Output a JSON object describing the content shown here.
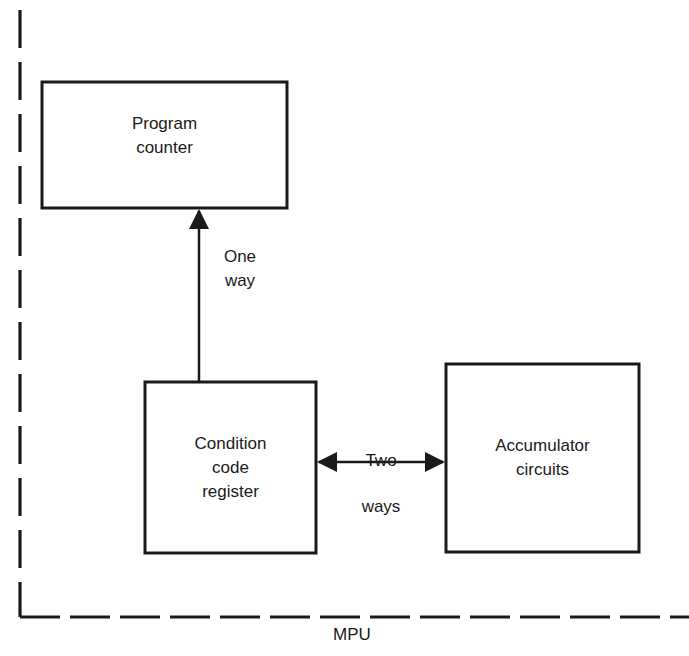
{
  "diagram": {
    "boundary": {
      "label": "MPU",
      "style": "dashed"
    },
    "blocks": [
      {
        "id": "program-counter",
        "label": "Program\ncounter"
      },
      {
        "id": "condition-code-register",
        "label": "Condition\ncode\nregister"
      },
      {
        "id": "accumulator-circuits",
        "label": "Accumulator\ncircuits"
      }
    ],
    "connections": [
      {
        "from": "condition-code-register",
        "to": "program-counter",
        "label": "One\nway",
        "direction": "one-way"
      },
      {
        "from": "condition-code-register",
        "to": "accumulator-circuits",
        "label": "Two\nways",
        "direction": "two-way"
      }
    ],
    "colors": {
      "stroke": "#1a1a1a",
      "background": "#ffffff"
    }
  }
}
